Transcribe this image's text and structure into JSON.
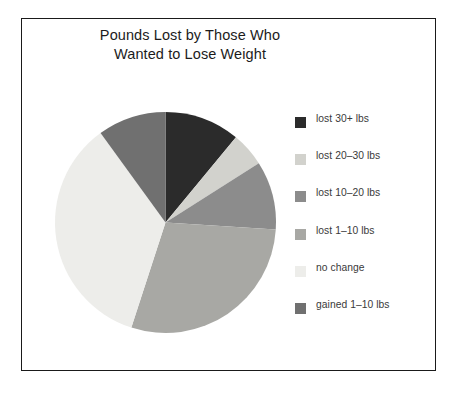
{
  "figure": {
    "background_color": "#ffffff",
    "frame_border_color": "#1a1a1a"
  },
  "chart_data": {
    "type": "pie",
    "title": "Pounds Lost by Those Who\nWanted to Lose Weight",
    "xlabel": "",
    "ylabel": "",
    "grid": false,
    "legend_position": "right",
    "start_angle_deg": 90,
    "direction": "clockwise",
    "categories": [
      "lost 30+ lbs",
      "lost 20–30 lbs",
      "lost 10–20 lbs",
      "lost 1–10 lbs",
      "no change",
      "gained 1–10 lbs"
    ],
    "values": [
      11,
      5,
      10,
      29,
      35,
      10
    ],
    "angles_deg": [
      39.6,
      18.0,
      36.0,
      104.4,
      126.0,
      36.0
    ],
    "colors": [
      "#2b2b2b",
      "#d2d2cd",
      "#8c8c8c",
      "#a8a8a4",
      "#ededea",
      "#707070"
    ],
    "slices": [
      {
        "label": "lost 30+ lbs",
        "value": 11,
        "angle_deg": 39.6,
        "color": "#2b2b2b"
      },
      {
        "label": "lost 20–30 lbs",
        "value": 5,
        "angle_deg": 18.0,
        "color": "#d2d2cd"
      },
      {
        "label": "lost 10–20 lbs",
        "value": 10,
        "angle_deg": 36.0,
        "color": "#8c8c8c"
      },
      {
        "label": "lost 1–10 lbs",
        "value": 29,
        "angle_deg": 104.4,
        "color": "#a8a8a4"
      },
      {
        "label": "no change",
        "value": 35,
        "angle_deg": 126.0,
        "color": "#ededea"
      },
      {
        "label": "gained 1–10 lbs",
        "value": 10,
        "angle_deg": 36.0,
        "color": "#707070"
      }
    ]
  },
  "legend": {
    "items": [
      {
        "label": "lost 30+ lbs",
        "color": "#2b2b2b"
      },
      {
        "label": "lost 20–30 lbs",
        "color": "#d2d2cd"
      },
      {
        "label": "lost 10–20 lbs",
        "color": "#8c8c8c"
      },
      {
        "label": "lost 1–10 lbs",
        "color": "#a8a8a4"
      },
      {
        "label": "no change",
        "color": "#ededea"
      },
      {
        "label": "gained 1–10 lbs",
        "color": "#707070"
      }
    ]
  }
}
